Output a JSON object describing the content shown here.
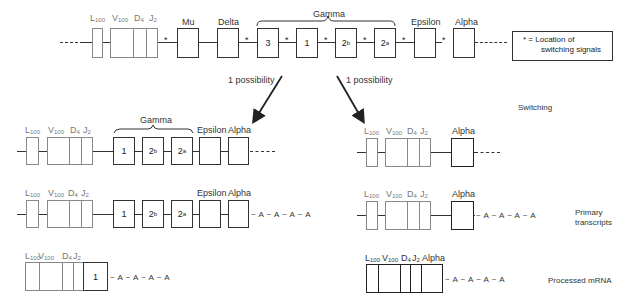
{
  "top_row": {
    "labels": {
      "L": "L",
      "L_sub": "100",
      "V": "V",
      "V_sub": "100",
      "D": "D",
      "D_sub": "4",
      "J": "J",
      "J_sub": "2",
      "mu": "Mu",
      "delta": "Delta",
      "gamma": "Gamma",
      "epsilon": "Epsilon",
      "alpha": "Alpha"
    },
    "gamma_boxes": [
      "3",
      "1",
      "2",
      "2"
    ],
    "gamma_subs": [
      "",
      "",
      "b",
      "a"
    ],
    "star": "*",
    "legend": {
      "line1": "* = Location of",
      "line2": "switching signals"
    }
  },
  "arrows": {
    "left_label": "1 possibility",
    "right_label": "1 possibility"
  },
  "side_labels": {
    "switching": "Switching",
    "primary_line1": "Primary",
    "primary_line2": "transcripts",
    "processed": "Processed mRNA"
  },
  "left": {
    "gamma_label": "Gamma",
    "epsilon": "Epsilon",
    "alpha": "Alpha",
    "gamma_boxes": [
      "1",
      "2",
      "2"
    ],
    "gamma_subs": [
      "",
      "b",
      "a"
    ],
    "mrna_box": "1",
    "polyA": "A",
    "tail": "~ A ~ A ~ A ~ A"
  },
  "right": {
    "alpha": "Alpha",
    "tail": "~ A ~ A ~ A ~ A"
  },
  "seg_labels": {
    "L": "L",
    "L_sub": "100",
    "V": "V",
    "V_sub": "100",
    "D": "D",
    "D_sub": "4",
    "J": "J",
    "J_sub": "2"
  }
}
